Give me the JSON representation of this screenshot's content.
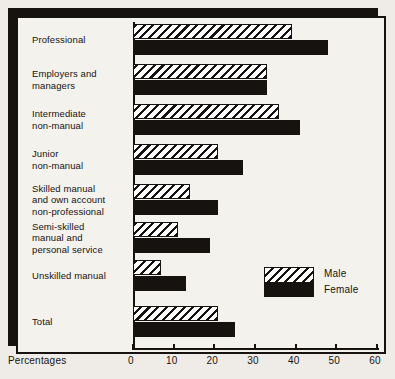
{
  "chart_data": {
    "type": "bar",
    "orientation": "horizontal",
    "title": "",
    "xlabel": "Percentages",
    "ylabel": "",
    "xlim": [
      0,
      60
    ],
    "xticks": [
      0,
      10,
      20,
      30,
      40,
      50,
      60
    ],
    "xtick_labels": [
      "0",
      "10",
      "20",
      "30",
      "40",
      "50",
      "60"
    ],
    "grid": false,
    "legend_position": "inside-right",
    "categories": [
      "Professional",
      "Employers and managers",
      "Intermediate non-manual",
      "Junior non-manual",
      "Skilled manual and own account non-professional",
      "Semi-skilled manual and personal service",
      "Unskilled manual",
      "Total"
    ],
    "series": [
      {
        "name": "Male",
        "pattern": "diagonal-hatch",
        "color": "#ffffff",
        "values": [
          39,
          33,
          36,
          21,
          14,
          11,
          7,
          21
        ]
      },
      {
        "name": "Female",
        "pattern": "solid",
        "color": "#16120f",
        "values": [
          48,
          33,
          41,
          27,
          21,
          19,
          13,
          25
        ]
      }
    ]
  },
  "category_label_lines": [
    [
      "Professional"
    ],
    [
      "Employers and",
      "managers"
    ],
    [
      "Intermediate",
      "non-manual"
    ],
    [
      "Junior",
      "non-manual"
    ],
    [
      "Skilled manual",
      "and own account",
      "non-professional"
    ],
    [
      "Semi-skilled",
      "manual and",
      "personal service"
    ],
    [
      "Unskilled manual"
    ],
    [
      "Total"
    ]
  ],
  "legend": {
    "male_label": "Male",
    "female_label": "Female"
  },
  "axis": {
    "x_caption": "Percentages"
  },
  "colors": {
    "ink": "#16120f",
    "plate": "#f4f2ed",
    "page": "#efece7"
  }
}
